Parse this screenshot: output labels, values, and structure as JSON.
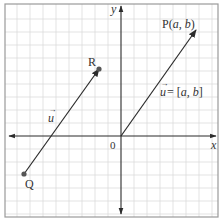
{
  "diagram": {
    "type": "coordinate-plane-vectors",
    "axes": {
      "x_label": "x",
      "y_label": "y",
      "origin_label": "0"
    },
    "grid": {
      "spacing_px": 13,
      "color": "#d9d9d9",
      "border_color": "#9a9a9a"
    },
    "points": {
      "P": {
        "label": "P(a, b)",
        "name": "P",
        "coords": "(a, b)"
      },
      "R": {
        "label": "R"
      },
      "Q": {
        "label": "Q"
      }
    },
    "vectors": [
      {
        "name": "u-position",
        "from": "origin",
        "to": "P",
        "label": "ū = [a, b]",
        "label_vec": "u",
        "label_rest": " = [a, b]"
      },
      {
        "name": "u-translated",
        "from": "Q",
        "to": "R",
        "label": "ū",
        "label_vec": "u"
      }
    ],
    "colors": {
      "axis": "#2b2b2b",
      "vector": "#2b2b2b",
      "text": "#333333"
    }
  }
}
